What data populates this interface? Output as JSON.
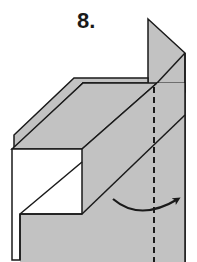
{
  "diagram": {
    "step_label": "8.",
    "colors": {
      "paper_gray": "#c2c2c2",
      "paper_white": "#ffffff",
      "line": "#1a1a1a"
    },
    "elements": {
      "fold_line": "dashed-vertical",
      "arrow": "curved-arrow-right"
    }
  }
}
